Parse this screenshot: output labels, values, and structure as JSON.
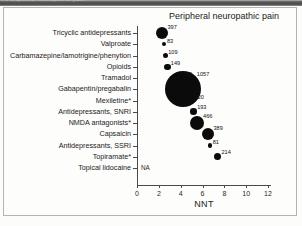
{
  "caption_strip": {
    "text": "Peripheral neuropathic pain"
  },
  "chart_data": {
    "type": "scatter",
    "title": "Peripheral neuropathic pain",
    "xlabel": "NNT",
    "ylabel": "",
    "xlim": [
      0,
      13.2
    ],
    "xticks": [
      0,
      2,
      4,
      6,
      8,
      10,
      12
    ],
    "xtick_labels": [
      "0",
      "2",
      "4",
      "6",
      "8",
      "10",
      "12"
    ],
    "grid": false,
    "legend": null,
    "note": "Bubble area is proportional to the number of patients (value shown next to each bubble).",
    "categories": [
      "Tricyclic antidepressants",
      "Valproate",
      "Carbamazepine/lamotrigine/phenytion",
      "Opioids",
      "Tramadol",
      "Gabapentin/pregabalin",
      "Mexiletine*",
      "Antidepressants, SNRI",
      "NMDA antagonists*",
      "Capsaicin",
      "Antidepressants, SSRI",
      "Topiramate*",
      "Topical lidocaine"
    ],
    "points": [
      {
        "category": "Tricyclic antidepressants",
        "nnt": 2.3,
        "n": 397,
        "label": "397",
        "size": 12.0
      },
      {
        "category": "Valproate",
        "nnt": 2.5,
        "n": 83,
        "label": "83",
        "size": 4.4
      },
      {
        "category": "Carbamazepine/lamotrigine/phenytion",
        "nnt": 2.6,
        "n": 109,
        "label": "109",
        "size": 5.2
      },
      {
        "category": "Opioids",
        "nnt": 2.8,
        "n": 149,
        "label": "149",
        "size": 6.2
      },
      {
        "category": "Tramadol",
        "nnt": 3.9,
        "n": 150,
        "label": "150",
        "size": 6.2
      },
      {
        "category": "Gabapentin/pregabalin",
        "nnt": 4.2,
        "n": 1057,
        "label": "1057",
        "size": 36.0
      },
      {
        "category": "Mexiletine*",
        "nnt": 5.0,
        "n": 120,
        "label": "120",
        "size": 5.4
      },
      {
        "category": "Antidepressants, SNRI",
        "nnt": 5.2,
        "n": 193,
        "label": "193",
        "size": 6.6
      },
      {
        "category": "NMDA antagonists*",
        "nnt": 5.5,
        "n": 466,
        "label": "466",
        "size": 14.0
      },
      {
        "category": "Capsaicin",
        "nnt": 6.5,
        "n": 389,
        "label": "389",
        "size": 12.4
      },
      {
        "category": "Antidepressants, SSRI",
        "nnt": 6.7,
        "n": 81,
        "label": "81",
        "size": 4.2
      },
      {
        "category": "Topiramate*",
        "nnt": 7.4,
        "n": 214,
        "label": "214",
        "size": 7.4
      },
      {
        "category": "Topical lidocaine",
        "nnt": null,
        "n": null,
        "label": "NA",
        "size": 0
      }
    ]
  }
}
